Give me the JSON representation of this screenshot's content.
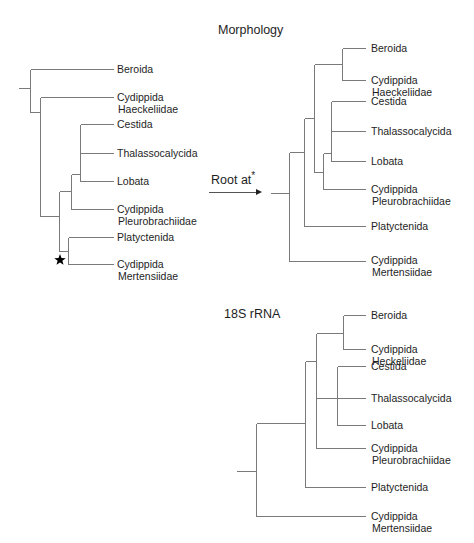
{
  "titles": {
    "morphology": "Morphology",
    "rrna": "18S rRNA",
    "root_at": "Root at",
    "root_star": "*"
  },
  "colors": {
    "line": "#7a7a7a",
    "text": "#1e1e1e",
    "background": "#ffffff",
    "star": "#000000"
  },
  "trees": [
    {
      "id": "original-morphology",
      "label_x": 117,
      "taxa": [
        {
          "lines": [
            "Beroida"
          ],
          "y": 69
        },
        {
          "lines": [
            "Cydippida",
            "Haeckeliidae"
          ],
          "y": 97
        },
        {
          "lines": [
            "Cestida"
          ],
          "y": 124
        },
        {
          "lines": [
            "Thalassocalycida"
          ],
          "y": 153
        },
        {
          "lines": [
            "Lobata"
          ],
          "y": 181
        },
        {
          "lines": [
            "Cydippida",
            "Pleurobrachiidae"
          ],
          "y": 209
        },
        {
          "lines": [
            "Platyctenida"
          ],
          "y": 237
        },
        {
          "lines": [
            "Cydippida",
            "Mertensiidae"
          ],
          "y": 264
        }
      ],
      "edges": [
        [
          18,
          88,
          30,
          88
        ],
        [
          30,
          69,
          30,
          112
        ],
        [
          30,
          69,
          113,
          69
        ],
        [
          30,
          112,
          40,
          112
        ],
        [
          40,
          97,
          40,
          216
        ],
        [
          40,
          97,
          113,
          97
        ],
        [
          40,
          216,
          59,
          216
        ],
        [
          59,
          191,
          59,
          251
        ],
        [
          59,
          191,
          71,
          191
        ],
        [
          71,
          174,
          71,
          209
        ],
        [
          71,
          174,
          80,
          174
        ],
        [
          80,
          124,
          80,
          181
        ],
        [
          80,
          124,
          113,
          124
        ],
        [
          80,
          153,
          113,
          153
        ],
        [
          80,
          181,
          113,
          181
        ],
        [
          71,
          209,
          113,
          209
        ],
        [
          59,
          251,
          68,
          251
        ],
        [
          68,
          237,
          68,
          264
        ],
        [
          68,
          237,
          113,
          237
        ],
        [
          68,
          264,
          113,
          264
        ]
      ],
      "star": {
        "x": 60,
        "y": 260
      }
    },
    {
      "id": "rerooted-morphology",
      "label_x": 371,
      "taxa": [
        {
          "lines": [
            "Beroida"
          ],
          "y": 48
        },
        {
          "lines": [
            "Cydippida",
            "Haeckeliidae"
          ],
          "y": 80
        },
        {
          "lines": [
            "Cestida"
          ],
          "y": 101
        },
        {
          "lines": [
            "Thalassocalycida"
          ],
          "y": 131
        },
        {
          "lines": [
            "Lobata"
          ],
          "y": 161
        },
        {
          "lines": [
            "Cydippida",
            "Pleurobrachiidae"
          ],
          "y": 189
        },
        {
          "lines": [
            "Platyctenida"
          ],
          "y": 226
        },
        {
          "lines": [
            "Cydippida",
            "Mertensiidae"
          ],
          "y": 260
        }
      ],
      "edges": [
        [
          270,
          193,
          289,
          193
        ],
        [
          289,
          152,
          289,
          261
        ],
        [
          289,
          152,
          304,
          152
        ],
        [
          289,
          261,
          365,
          261
        ],
        [
          304,
          118,
          304,
          226
        ],
        [
          304,
          118,
          314,
          118
        ],
        [
          304,
          226,
          365,
          226
        ],
        [
          314,
          64,
          314,
          172
        ],
        [
          314,
          64,
          342,
          64
        ],
        [
          342,
          48,
          342,
          80
        ],
        [
          342,
          48,
          365,
          48
        ],
        [
          342,
          80,
          365,
          80
        ],
        [
          314,
          172,
          323,
          172
        ],
        [
          323,
          153,
          323,
          189
        ],
        [
          323,
          153,
          331,
          153
        ],
        [
          331,
          101,
          331,
          161
        ],
        [
          331,
          101,
          365,
          101
        ],
        [
          331,
          131,
          365,
          131
        ],
        [
          331,
          161,
          365,
          161
        ],
        [
          323,
          189,
          365,
          189
        ]
      ]
    },
    {
      "id": "18s-rrna",
      "label_x": 371,
      "taxa": [
        {
          "lines": [
            "Beroida"
          ],
          "y": 315
        },
        {
          "lines": [
            "Cydippida",
            "Heckeliidae"
          ],
          "y": 349
        },
        {
          "lines": [
            "Cestida"
          ],
          "y": 366
        },
        {
          "lines": [
            "Thalassocalycida"
          ],
          "y": 398
        },
        {
          "lines": [
            "Lobata"
          ],
          "y": 425
        },
        {
          "lines": [
            "Cydippida",
            "Pleurobrachiidae"
          ],
          "y": 448
        },
        {
          "lines": [
            "Platyctenida"
          ],
          "y": 487
        },
        {
          "lines": [
            "Cydippida",
            "Mertensiidae"
          ],
          "y": 516
        }
      ],
      "edges": [
        [
          236,
          471,
          256,
          471
        ],
        [
          256,
          423,
          256,
          516
        ],
        [
          256,
          423,
          305,
          423
        ],
        [
          256,
          516,
          365,
          516
        ],
        [
          305,
          361,
          305,
          487
        ],
        [
          305,
          361,
          316,
          361
        ],
        [
          305,
          487,
          365,
          487
        ],
        [
          316,
          333,
          316,
          448
        ],
        [
          316,
          333,
          343,
          333
        ],
        [
          343,
          315,
          343,
          349
        ],
        [
          343,
          315,
          365,
          315
        ],
        [
          343,
          349,
          365,
          349
        ],
        [
          316,
          398,
          365,
          398
        ],
        [
          337,
          366,
          337,
          425
        ],
        [
          337,
          366,
          365,
          366
        ],
        [
          337,
          425,
          365,
          425
        ],
        [
          316,
          448,
          365,
          448
        ]
      ]
    }
  ],
  "arrow": {
    "x1": 209,
    "y1": 192,
    "x2": 262,
    "y2": 192
  },
  "title_positions": {
    "morphology": {
      "x": 218,
      "y": 34
    },
    "rrna": {
      "x": 224,
      "y": 318
    },
    "root_at": {
      "x": 211,
      "y": 184
    }
  }
}
